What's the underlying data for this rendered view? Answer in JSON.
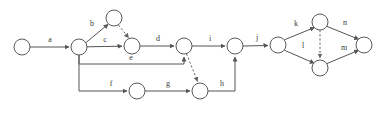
{
  "diagram": {
    "canvas": {
      "width": 386,
      "height": 115,
      "background": "#ffffff"
    },
    "style": {
      "node_stroke": "#5a5a5a",
      "node_fill": "#ffffff",
      "edge_solid_color": "#555555",
      "edge_dashed_color": "#666666",
      "label_color": "#3a3a3a",
      "node_radius": 8
    },
    "nodes": [
      {
        "id": "n0",
        "cx": 22,
        "cy": 47,
        "r": 8
      },
      {
        "id": "n1",
        "cx": 79,
        "cy": 47,
        "r": 8
      },
      {
        "id": "n2",
        "cx": 114,
        "cy": 18,
        "r": 8
      },
      {
        "id": "n3",
        "cx": 132,
        "cy": 46,
        "r": 8
      },
      {
        "id": "n4",
        "cx": 184,
        "cy": 46,
        "r": 8
      },
      {
        "id": "n5",
        "cx": 235,
        "cy": 46,
        "r": 8
      },
      {
        "id": "n6",
        "cx": 278,
        "cy": 45,
        "r": 8
      },
      {
        "id": "n7",
        "cx": 320,
        "cy": 22,
        "r": 8
      },
      {
        "id": "n8",
        "cx": 320,
        "cy": 68,
        "r": 8
      },
      {
        "id": "n9",
        "cx": 364,
        "cy": 45,
        "r": 8
      },
      {
        "id": "n10",
        "cx": 137,
        "cy": 91,
        "r": 8
      },
      {
        "id": "n11",
        "cx": 200,
        "cy": 91,
        "r": 8
      }
    ],
    "edges": [
      {
        "id": "e-a",
        "label": "a",
        "from": "n0",
        "to": "n1",
        "style": "solid",
        "label_x": 50,
        "label_y": 40
      },
      {
        "id": "e-b",
        "label": "b",
        "from": "n1",
        "to": "n2",
        "style": "solid",
        "label_x": 92,
        "label_y": 24
      },
      {
        "id": "e-dashed-n2-n3",
        "label": "",
        "from": "n2",
        "to": "n3",
        "style": "dashed",
        "label_x": 0,
        "label_y": 0
      },
      {
        "id": "e-c",
        "label": "c",
        "from": "n1",
        "to": "n3",
        "style": "solid",
        "label_x": 105,
        "label_y": 40
      },
      {
        "id": "e-d",
        "label": "d",
        "from": "n3",
        "to": "n4",
        "style": "solid",
        "label_x": 158,
        "label_y": 39
      },
      {
        "id": "e-e",
        "label": "e",
        "from": "n1",
        "to": "n4",
        "style": "solid",
        "label_x": 131,
        "label_y": 58
      },
      {
        "id": "e-f",
        "label": "f",
        "from": "n1",
        "to": "n10",
        "style": "solid",
        "label_x": 111,
        "label_y": 84
      },
      {
        "id": "e-g",
        "label": "g",
        "from": "n10",
        "to": "n11",
        "style": "solid",
        "label_x": 168,
        "label_y": 84
      },
      {
        "id": "e-h",
        "label": "h",
        "from": "n11",
        "to": "n5",
        "style": "solid",
        "label_x": 222,
        "label_y": 84
      },
      {
        "id": "e-dashed-n4-n11",
        "label": "",
        "from": "n4",
        "to": "n11",
        "style": "dashed",
        "label_x": 0,
        "label_y": 0
      },
      {
        "id": "e-i",
        "label": "i",
        "from": "n4",
        "to": "n5",
        "style": "solid",
        "label_x": 210,
        "label_y": 39
      },
      {
        "id": "e-j",
        "label": "j",
        "from": "n5",
        "to": "n6",
        "style": "solid",
        "label_x": 257,
        "label_y": 38
      },
      {
        "id": "e-k",
        "label": "k",
        "from": "n6",
        "to": "n7",
        "style": "solid",
        "label_x": 296,
        "label_y": 24
      },
      {
        "id": "e-l",
        "label": "l",
        "from": "n6",
        "to": "n8",
        "style": "solid",
        "label_x": 303,
        "label_y": 46
      },
      {
        "id": "e-n",
        "label": "n",
        "from": "n7",
        "to": "n9",
        "style": "solid",
        "label_x": 345,
        "label_y": 23
      },
      {
        "id": "e-m",
        "label": "m",
        "from": "n8",
        "to": "n9",
        "style": "solid",
        "label_x": 344,
        "label_y": 48
      },
      {
        "id": "e-dashed-n7-n8",
        "label": "",
        "from": "n7",
        "to": "n8",
        "style": "dashed",
        "label_x": 0,
        "label_y": 0
      }
    ],
    "edge_labels": [
      {
        "id": "label-a",
        "text": "a",
        "x": 50,
        "y": 40
      },
      {
        "id": "label-b",
        "text": "b",
        "x": 92,
        "y": 24
      },
      {
        "id": "label-c",
        "text": "c",
        "x": 105,
        "y": 40
      },
      {
        "id": "label-d",
        "text": "d",
        "x": 158,
        "y": 39
      },
      {
        "id": "label-e",
        "text": "e",
        "x": 131,
        "y": 58
      },
      {
        "id": "label-f",
        "text": "f",
        "x": 111,
        "y": 84
      },
      {
        "id": "label-g",
        "text": "g",
        "x": 168,
        "y": 84
      },
      {
        "id": "label-h",
        "text": "h",
        "x": 222,
        "y": 84
      },
      {
        "id": "label-i",
        "text": "i",
        "x": 210,
        "y": 39
      },
      {
        "id": "label-j",
        "text": "j",
        "x": 257,
        "y": 38
      },
      {
        "id": "label-k",
        "text": "k",
        "x": 296,
        "y": 24
      },
      {
        "id": "label-l",
        "text": "l",
        "x": 303,
        "y": 46
      },
      {
        "id": "label-m",
        "text": "m",
        "x": 344,
        "y": 48
      },
      {
        "id": "label-n",
        "text": "n",
        "x": 345,
        "y": 23
      }
    ]
  }
}
